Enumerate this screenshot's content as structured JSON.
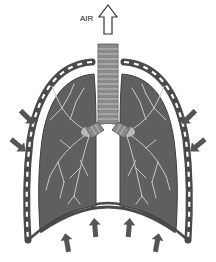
{
  "diagram": {
    "labels": {
      "air": "AIR"
    },
    "elements": [
      {
        "name": "air-outflow-arrow",
        "direction": "up",
        "style": "outlined"
      },
      {
        "name": "trachea",
        "style": "ringed tube"
      },
      {
        "name": "left-lung",
        "style": "dark gray with bronchial tree"
      },
      {
        "name": "right-lung",
        "style": "dark gray with bronchial tree"
      },
      {
        "name": "pleura",
        "style": "outer dark band with white dashes"
      },
      {
        "name": "diaphragm",
        "style": "dark arched band"
      },
      {
        "name": "rib-compression-arrows",
        "count": 4,
        "direction": "inward"
      },
      {
        "name": "diaphragm-push-arrows",
        "count": 4,
        "direction": "up"
      }
    ],
    "colors": {
      "lung_fill": "#5f5f5f",
      "pleura_band": "#4a4a4a",
      "airway_lines": "#c8c8c8",
      "trachea_fill": "#8a8a8a",
      "arrow_fill": "#555555",
      "background": "#ffffff"
    }
  }
}
